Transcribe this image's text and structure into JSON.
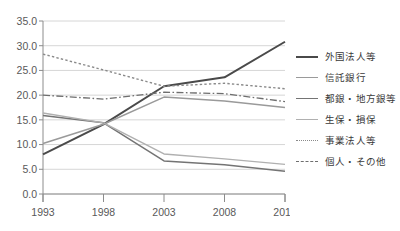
{
  "chart_data": {
    "type": "line",
    "title": "",
    "xlabel": "",
    "ylabel": "",
    "categories": [
      "1993",
      "1998",
      "2003",
      "2008",
      "2013"
    ],
    "x": [
      1993,
      1998,
      2003,
      2008,
      2013
    ],
    "ylim": [
      0.0,
      35.0
    ],
    "yticks": [
      "0.0",
      "5.0",
      "10.0",
      "15.0",
      "20.0",
      "25.0",
      "30.0",
      "35.0"
    ],
    "ytick_values": [
      0.0,
      5.0,
      10.0,
      15.0,
      20.0,
      25.0,
      30.0,
      35.0
    ],
    "grid": true,
    "legend_position": "right",
    "series": [
      {
        "name": "外国法人等",
        "values": [
          8.0,
          14.1,
          21.8,
          23.6,
          30.8
        ],
        "color": "#4a4a4a",
        "style": "solid",
        "width": 2.0
      },
      {
        "name": "信託銀行",
        "values": [
          10.2,
          14.1,
          19.6,
          18.8,
          17.5
        ],
        "color": "#9a9a9a",
        "style": "solid",
        "width": 1.5
      },
      {
        "name": "都銀・地方銀等",
        "values": [
          15.9,
          14.4,
          6.7,
          5.9,
          4.6
        ],
        "color": "#747474",
        "style": "solid",
        "width": 1.5
      },
      {
        "name": "生保・損保",
        "values": [
          16.4,
          14.4,
          8.1,
          7.1,
          6.0
        ],
        "color": "#b0b0b0",
        "style": "solid",
        "width": 1.4
      },
      {
        "name": "事業法人等",
        "values": [
          28.3,
          25.1,
          21.8,
          22.4,
          21.3
        ],
        "color": "#8a8a8a",
        "style": "dotted",
        "width": 1.4
      },
      {
        "name": "個人・その他",
        "values": [
          20.0,
          19.2,
          20.6,
          20.3,
          18.7
        ],
        "color": "#6e6e6e",
        "style": "dashdot",
        "width": 1.3
      }
    ],
    "axis": {
      "line_color": "#8c8c8c",
      "grid_color": "#d6d6d6",
      "tick_label_color": "#595959"
    }
  },
  "legend": {
    "items": [
      {
        "label": "外国法人等"
      },
      {
        "label": "信託銀行"
      },
      {
        "label": "都銀・地方銀等"
      },
      {
        "label": "生保・損保"
      },
      {
        "label": "事業法人等"
      },
      {
        "label": "個人・その他"
      }
    ]
  }
}
